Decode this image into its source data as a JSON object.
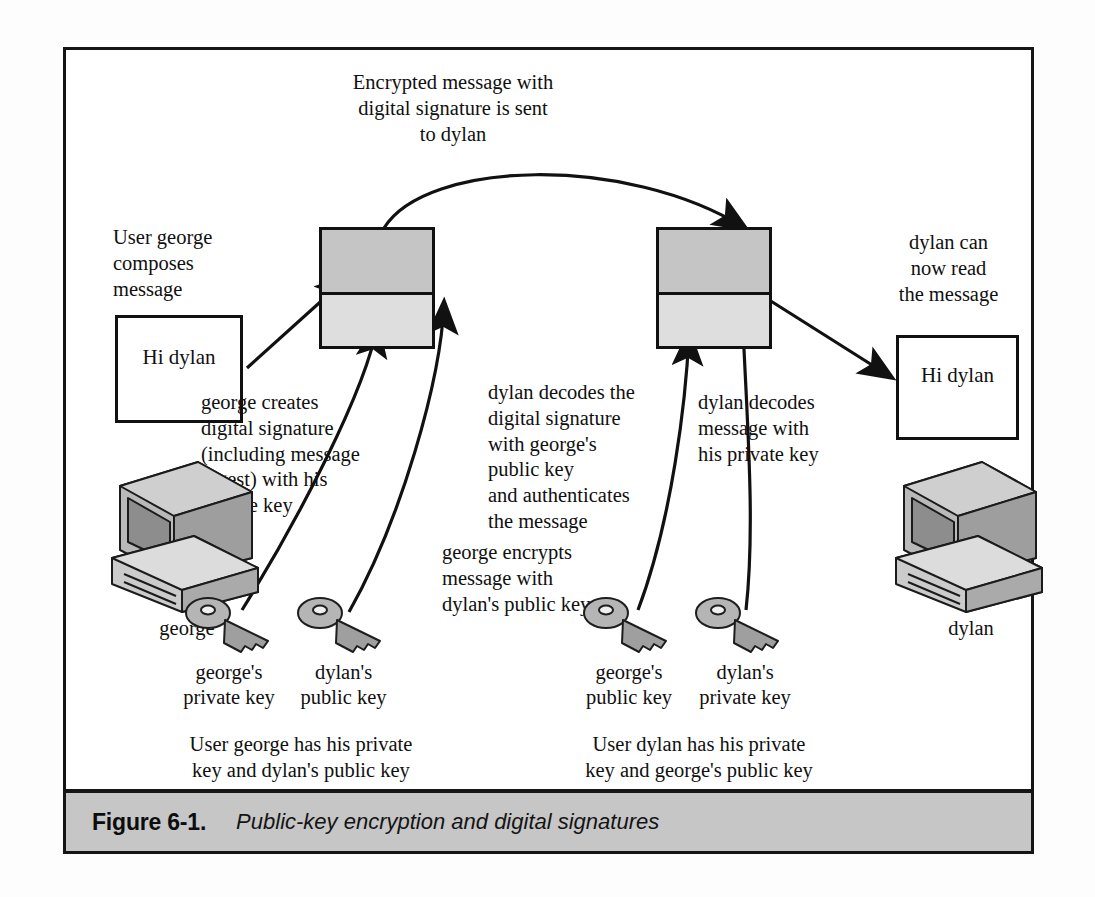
{
  "figure": {
    "caption_label": "Figure 6-1.",
    "caption_text": "Public-key encryption and digital signatures"
  },
  "annotations": {
    "top_flow": "Encrypted message with\ndigital signature is sent\nto dylan",
    "compose": "User george\ncomposes\nmessage",
    "sign": "george creates\ndigital signature\n(including message\ndigest) with his\nprivate key",
    "encrypt": "george encrypts\nmessage with\ndylan's public key",
    "verify": "dylan decodes the\ndigital signature\nwith george's\npublic key\nand authenticates\nthe message",
    "decrypt": "dylan decodes\nmessage with\nhis private key",
    "read": "dylan can\nnow read\nthe message",
    "george_keys_note": "User george has his private\nkey and dylan's public key",
    "dylan_keys_note": "User dylan has his private\nkey and george's public key"
  },
  "messages": {
    "plaintext_left": "Hi dylan",
    "plaintext_right": "Hi dylan"
  },
  "machines": [
    {
      "name": "george",
      "icon": "computer-icon"
    },
    {
      "name": "dylan",
      "icon": "computer-icon"
    }
  ],
  "keys": [
    {
      "id": "george-private-key",
      "label": "george's\nprivate key",
      "icon": "key-icon"
    },
    {
      "id": "dylan-public-key",
      "label": "dylan's\npublic key",
      "icon": "key-icon"
    },
    {
      "id": "george-public-key",
      "label": "george's\npublic key",
      "icon": "key-icon"
    },
    {
      "id": "dylan-private-key",
      "label": "dylan's\nprivate key",
      "icon": "key-icon"
    }
  ],
  "colors": {
    "frame": "#151515",
    "caption_band": "#c6c6c6",
    "cipher_block": "#c5c5c5",
    "signature_block": "#dedede",
    "paper": "#ffffff",
    "ink": "#101010"
  }
}
